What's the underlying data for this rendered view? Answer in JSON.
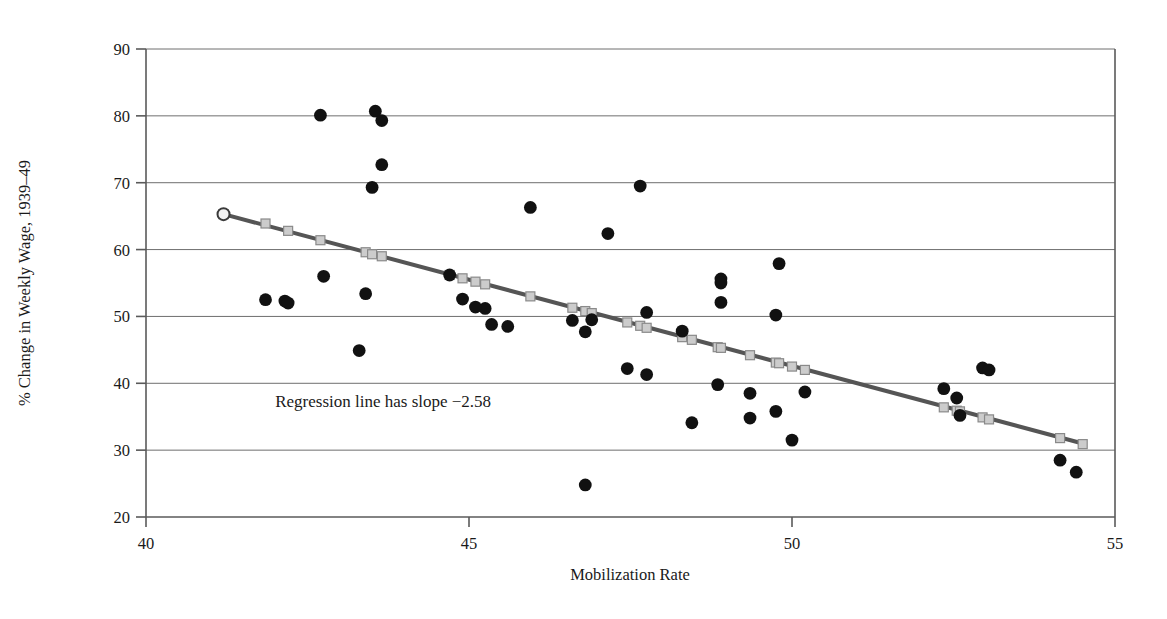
{
  "chart_data": {
    "type": "scatter",
    "title": "",
    "xlabel": "Mobilization Rate",
    "ylabel": "% Change in Weekly Wage, 1939–49",
    "xlim": [
      40,
      55
    ],
    "ylim": [
      20,
      90
    ],
    "xticks": [
      40,
      45,
      50,
      55
    ],
    "yticks": [
      20,
      30,
      40,
      50,
      60,
      70,
      80,
      90
    ],
    "grid": "horizontal",
    "legend": "none",
    "annotations": [
      {
        "text": "Regression line has slope −2.58",
        "x": 42.0,
        "y": 36.5
      }
    ],
    "series": [
      {
        "name": "States",
        "marker": "filled-circle",
        "color": "#111111",
        "points": [
          [
            42.7,
            80.1
          ],
          [
            43.55,
            80.7
          ],
          [
            43.65,
            79.3
          ],
          [
            43.65,
            72.7
          ],
          [
            43.5,
            69.3
          ],
          [
            47.65,
            69.5
          ],
          [
            45.95,
            66.3
          ],
          [
            47.15,
            62.4
          ],
          [
            49.8,
            57.9
          ],
          [
            48.9,
            55.6
          ],
          [
            48.9,
            55.0
          ],
          [
            42.75,
            56.0
          ],
          [
            43.4,
            53.4
          ],
          [
            44.7,
            56.2
          ],
          [
            48.9,
            52.1
          ],
          [
            41.85,
            52.5
          ],
          [
            42.15,
            52.3
          ],
          [
            42.2,
            52.0
          ],
          [
            44.9,
            52.6
          ],
          [
            49.75,
            50.2
          ],
          [
            45.25,
            51.2
          ],
          [
            45.35,
            48.8
          ],
          [
            45.6,
            48.5
          ],
          [
            47.75,
            50.6
          ],
          [
            45.1,
            51.4
          ],
          [
            46.6,
            49.4
          ],
          [
            46.9,
            49.5
          ],
          [
            46.8,
            47.7
          ],
          [
            48.3,
            47.8
          ],
          [
            43.3,
            44.9
          ],
          [
            47.45,
            42.2
          ],
          [
            47.75,
            41.3
          ],
          [
            50.2,
            38.7
          ],
          [
            48.85,
            39.8
          ],
          [
            49.35,
            38.5
          ],
          [
            49.75,
            35.8
          ],
          [
            49.35,
            34.8
          ],
          [
            48.45,
            34.1
          ],
          [
            50.0,
            31.5
          ],
          [
            46.8,
            24.8
          ],
          [
            52.35,
            39.2
          ],
          [
            52.55,
            37.8
          ],
          [
            52.6,
            35.2
          ],
          [
            52.95,
            42.3
          ],
          [
            53.05,
            42.0
          ],
          [
            54.15,
            28.5
          ],
          [
            54.4,
            26.7
          ]
        ]
      }
    ],
    "regression_line": {
      "name": "Regression line",
      "slope": -2.58,
      "marker": "open-square",
      "line_color": "#555555",
      "marker_fill": "#cccccc",
      "marker_stroke": "#8a8a8a",
      "endpoint_marker": "open-circle",
      "x_start": 41.2,
      "y_start": 65.3,
      "x_end": 54.5,
      "y_end": 31.0,
      "fitted_points": [
        [
          41.2,
          65.3
        ],
        [
          41.85,
          63.9
        ],
        [
          42.2,
          62.8
        ],
        [
          42.7,
          61.4
        ],
        [
          43.4,
          59.6
        ],
        [
          43.5,
          59.3
        ],
        [
          43.65,
          59.0
        ],
        [
          44.7,
          56.2
        ],
        [
          44.9,
          55.7
        ],
        [
          45.1,
          55.2
        ],
        [
          45.25,
          54.8
        ],
        [
          45.95,
          53.0
        ],
        [
          46.6,
          51.3
        ],
        [
          46.8,
          50.8
        ],
        [
          46.9,
          50.5
        ],
        [
          47.45,
          49.1
        ],
        [
          47.65,
          48.6
        ],
        [
          47.75,
          48.3
        ],
        [
          48.3,
          46.9
        ],
        [
          48.45,
          46.5
        ],
        [
          48.85,
          45.4
        ],
        [
          48.9,
          45.3
        ],
        [
          49.35,
          44.2
        ],
        [
          49.75,
          43.1
        ],
        [
          49.8,
          43.0
        ],
        [
          50.0,
          42.5
        ],
        [
          50.2,
          42.0
        ],
        [
          52.35,
          36.4
        ],
        [
          52.55,
          35.9
        ],
        [
          52.6,
          35.8
        ],
        [
          52.95,
          34.9
        ],
        [
          53.05,
          34.6
        ],
        [
          54.15,
          31.8
        ],
        [
          54.5,
          30.9
        ]
      ]
    }
  },
  "geometry": {
    "plot_left": 146,
    "plot_right": 1115,
    "plot_top": 49,
    "plot_bottom": 517
  }
}
